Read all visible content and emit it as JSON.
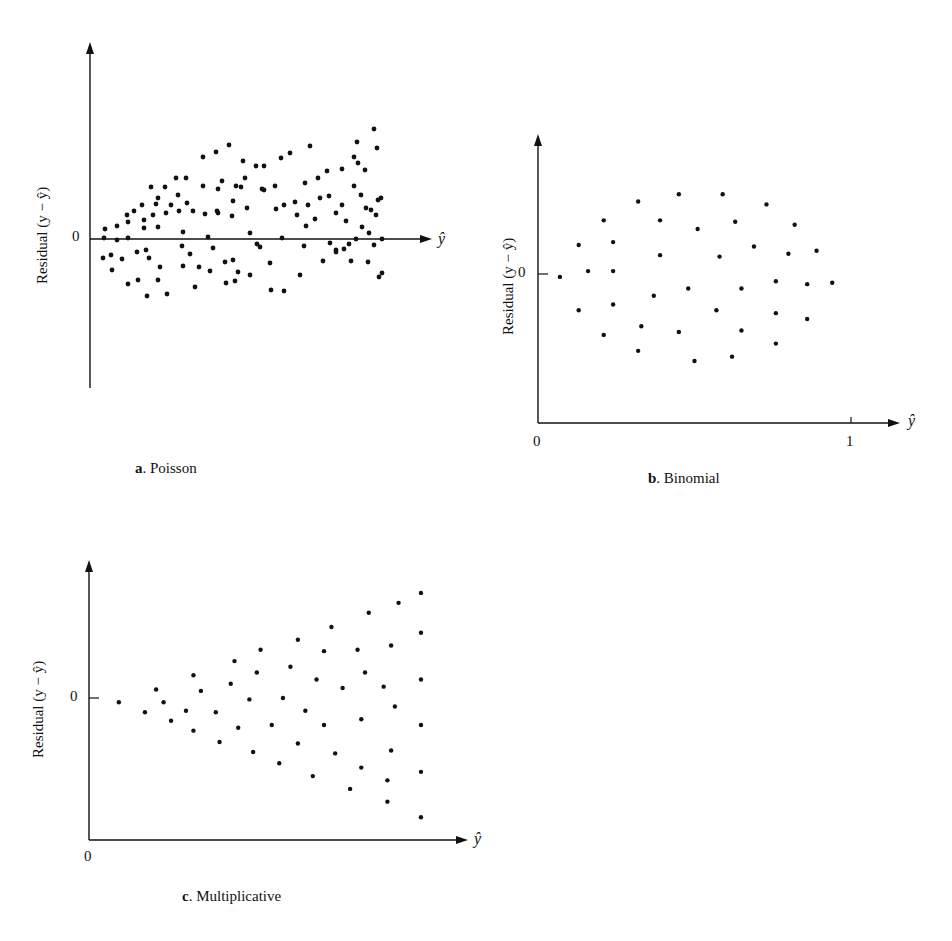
{
  "panels": [
    {
      "id": "a",
      "letter": "a",
      "caption": ". Poisson",
      "ylabel": "Residual (y − ŷ)",
      "zero_label": "0",
      "x_axis_label": "ŷ"
    },
    {
      "id": "b",
      "letter": "b",
      "caption": ". Binomial",
      "ylabel": "Residual (y − ŷ)",
      "zero_label": "0",
      "x_origin_label": "0",
      "x_one_label": "1",
      "x_axis_label": "ŷ"
    },
    {
      "id": "c",
      "letter": "c",
      "caption": ". Multiplicative",
      "ylabel": "Residual (y − ŷ)",
      "zero_label": "0",
      "x_origin_label": "0",
      "x_axis_label": "ŷ"
    }
  ],
  "chart_data": [
    {
      "type": "scatter",
      "title": "a. Poisson",
      "xlabel": "ŷ",
      "ylabel": "Residual (y − ŷ)",
      "description": "Residuals fan out: spread increases with ŷ (variance proportional to mean)",
      "grid": false,
      "points_px": [
        [
          105,
          229
        ],
        [
          104,
          238
        ],
        [
          103,
          258
        ],
        [
          111,
          255
        ],
        [
          112,
          270
        ],
        [
          117,
          226
        ],
        [
          117,
          240
        ],
        [
          122,
          259
        ],
        [
          127,
          215
        ],
        [
          128,
          222
        ],
        [
          128,
          238
        ],
        [
          128,
          284
        ],
        [
          134,
          211
        ],
        [
          137,
          252
        ],
        [
          138,
          280
        ],
        [
          142,
          205
        ],
        [
          144,
          220
        ],
        [
          144,
          228
        ],
        [
          146,
          250
        ],
        [
          147,
          296
        ],
        [
          149,
          258
        ],
        [
          151,
          187
        ],
        [
          153,
          215
        ],
        [
          156,
          204
        ],
        [
          158,
          227
        ],
        [
          158,
          198
        ],
        [
          158,
          280
        ],
        [
          160,
          267
        ],
        [
          165,
          187
        ],
        [
          166,
          213
        ],
        [
          167,
          294
        ],
        [
          171,
          205
        ],
        [
          176,
          178
        ],
        [
          178,
          195
        ],
        [
          179,
          211
        ],
        [
          182,
          246
        ],
        [
          183,
          232
        ],
        [
          183,
          266
        ],
        [
          186,
          178
        ],
        [
          187,
          203
        ],
        [
          190,
          254
        ],
        [
          193,
          211
        ],
        [
          195,
          287
        ],
        [
          199,
          267
        ],
        [
          203,
          157
        ],
        [
          203,
          186
        ],
        [
          205,
          214
        ],
        [
          208,
          237
        ],
        [
          213,
          248
        ],
        [
          210,
          271
        ],
        [
          216,
          152
        ],
        [
          218,
          213
        ],
        [
          217,
          211
        ],
        [
          218,
          189
        ],
        [
          222,
          181
        ],
        [
          225,
          262
        ],
        [
          226,
          283
        ],
        [
          229,
          145
        ],
        [
          232,
          216
        ],
        [
          233,
          201
        ],
        [
          233,
          260
        ],
        [
          235,
          281
        ],
        [
          236,
          186
        ],
        [
          238,
          272
        ],
        [
          241,
          187
        ],
        [
          243,
          161
        ],
        [
          245,
          178
        ],
        [
          247,
          208
        ],
        [
          250,
          233
        ],
        [
          250,
          275
        ],
        [
          256,
          166
        ],
        [
          257,
          244
        ],
        [
          260,
          247
        ],
        [
          262,
          189
        ],
        [
          264,
          190
        ],
        [
          264,
          166
        ],
        [
          270,
          263
        ],
        [
          271,
          290
        ],
        [
          275,
          186
        ],
        [
          276,
          209
        ],
        [
          281,
          158
        ],
        [
          282,
          238
        ],
        [
          284,
          205
        ],
        [
          284,
          291
        ],
        [
          290,
          153
        ],
        [
          295,
          202
        ],
        [
          297,
          215
        ],
        [
          300,
          275
        ],
        [
          304,
          246
        ],
        [
          305,
          183
        ],
        [
          306,
          226
        ],
        [
          308,
          205
        ],
        [
          310,
          146
        ],
        [
          315,
          219
        ],
        [
          318,
          178
        ],
        [
          320,
          198
        ],
        [
          323,
          261
        ],
        [
          327,
          171
        ],
        [
          329,
          196
        ],
        [
          330,
          243
        ],
        [
          336,
          213
        ],
        [
          336,
          250
        ],
        [
          336,
          252
        ],
        [
          342,
          169
        ],
        [
          342,
          205
        ],
        [
          344,
          249
        ],
        [
          346,
          221
        ],
        [
          349,
          244
        ],
        [
          351,
          261
        ],
        [
          354,
          157
        ],
        [
          354,
          186
        ],
        [
          356,
          239
        ],
        [
          357,
          142
        ],
        [
          358,
          163
        ],
        [
          361,
          195
        ],
        [
          362,
          227
        ],
        [
          365,
          170
        ],
        [
          366,
          208
        ],
        [
          368,
          262
        ],
        [
          369,
          233
        ],
        [
          371,
          210
        ],
        [
          374,
          129
        ],
        [
          374,
          245
        ],
        [
          376,
          215
        ],
        [
          377,
          148
        ],
        [
          378,
          200
        ],
        [
          379,
          277
        ],
        [
          381,
          198
        ],
        [
          382,
          273
        ],
        [
          382,
          239
        ]
      ],
      "x_range_px": [
        95,
        430
      ],
      "zero_y_px": 239
    },
    {
      "type": "scatter",
      "title": "b. Binomial",
      "xlabel": "ŷ",
      "ylabel": "Residual (y − ŷ)",
      "description": "Residual spread largest near ŷ = 0.5, smaller near 0 and 1",
      "xlim": [
        0,
        1
      ],
      "x_ticks": [
        "0",
        "1"
      ],
      "grid": false,
      "points": [
        [
          0.07,
          -0.02
        ],
        [
          0.13,
          0.2
        ],
        [
          0.13,
          -0.25
        ],
        [
          0.16,
          0.02
        ],
        [
          0.21,
          0.37
        ],
        [
          0.21,
          -0.42
        ],
        [
          0.24,
          0.22
        ],
        [
          0.24,
          0.02
        ],
        [
          0.24,
          -0.21
        ],
        [
          0.32,
          0.5
        ],
        [
          0.32,
          -0.53
        ],
        [
          0.33,
          -0.36
        ],
        [
          0.37,
          -0.15
        ],
        [
          0.39,
          0.37
        ],
        [
          0.39,
          0.13
        ],
        [
          0.45,
          0.55
        ],
        [
          0.45,
          -0.4
        ],
        [
          0.48,
          -0.1
        ],
        [
          0.5,
          -0.6
        ],
        [
          0.51,
          0.31
        ],
        [
          0.57,
          -0.25
        ],
        [
          0.58,
          0.12
        ],
        [
          0.59,
          0.55
        ],
        [
          0.62,
          -0.57
        ],
        [
          0.63,
          0.36
        ],
        [
          0.65,
          -0.39
        ],
        [
          0.65,
          -0.1
        ],
        [
          0.69,
          0.19
        ],
        [
          0.73,
          0.48
        ],
        [
          0.76,
          -0.05
        ],
        [
          0.76,
          -0.27
        ],
        [
          0.76,
          -0.48
        ],
        [
          0.8,
          0.14
        ],
        [
          0.82,
          0.34
        ],
        [
          0.86,
          -0.07
        ],
        [
          0.86,
          -0.31
        ],
        [
          0.89,
          0.16
        ],
        [
          0.94,
          -0.06
        ]
      ],
      "ylim": [
        -1,
        1
      ]
    },
    {
      "type": "scatter",
      "title": "c. Multiplicative",
      "xlabel": "ŷ",
      "ylabel": "Residual (y − ŷ)",
      "description": "Residual spread increases linearly with ŷ (multiplicative error)",
      "x_ticks": [
        "0"
      ],
      "grid": false,
      "points": [
        [
          0.08,
          -0.03
        ],
        [
          0.15,
          -0.1
        ],
        [
          0.18,
          0.06
        ],
        [
          0.2,
          -0.03
        ],
        [
          0.22,
          -0.16
        ],
        [
          0.26,
          -0.09
        ],
        [
          0.28,
          0.16
        ],
        [
          0.28,
          -0.23
        ],
        [
          0.3,
          0.05
        ],
        [
          0.34,
          -0.1
        ],
        [
          0.35,
          -0.31
        ],
        [
          0.38,
          0.1
        ],
        [
          0.39,
          0.26
        ],
        [
          0.4,
          -0.21
        ],
        [
          0.43,
          -0.01
        ],
        [
          0.44,
          -0.38
        ],
        [
          0.45,
          0.18
        ],
        [
          0.46,
          0.34
        ],
        [
          0.49,
          -0.19
        ],
        [
          0.51,
          -0.46
        ],
        [
          0.52,
          0.0
        ],
        [
          0.54,
          0.22
        ],
        [
          0.56,
          0.41
        ],
        [
          0.56,
          -0.32
        ],
        [
          0.58,
          -0.09
        ],
        [
          0.6,
          -0.55
        ],
        [
          0.61,
          0.13
        ],
        [
          0.63,
          0.33
        ],
        [
          0.63,
          -0.19
        ],
        [
          0.65,
          0.5
        ],
        [
          0.66,
          -0.39
        ],
        [
          0.68,
          0.07
        ],
        [
          0.7,
          -0.64
        ],
        [
          0.72,
          0.34
        ],
        [
          0.73,
          -0.15
        ],
        [
          0.73,
          -0.49
        ],
        [
          0.74,
          0.18
        ],
        [
          0.75,
          0.6
        ],
        [
          0.79,
          0.08
        ],
        [
          0.8,
          -0.73
        ],
        [
          0.8,
          -0.58
        ],
        [
          0.81,
          0.37
        ],
        [
          0.81,
          -0.37
        ],
        [
          0.82,
          -0.06
        ],
        [
          0.83,
          0.67
        ],
        [
          0.89,
          0.74
        ],
        [
          0.89,
          0.46
        ],
        [
          0.89,
          0.13
        ],
        [
          0.89,
          -0.19
        ],
        [
          0.89,
          -0.52
        ],
        [
          0.89,
          -0.84
        ]
      ],
      "ylim": [
        -1,
        1
      ]
    }
  ]
}
